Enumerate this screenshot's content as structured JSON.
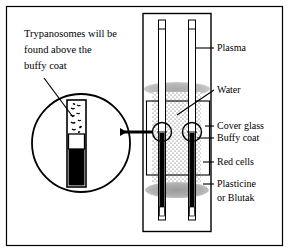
{
  "figure": {
    "title_annotation": {
      "lines": [
        "Trypanosomes will be",
        "found above the",
        "buffy coat"
      ]
    },
    "labels": [
      {
        "id": "plasma",
        "text": "Plasma"
      },
      {
        "id": "water",
        "text": "Water"
      },
      {
        "id": "cover-glass",
        "text": "Cover glass"
      },
      {
        "id": "buffy-coat",
        "text": "Buffy coat"
      },
      {
        "id": "red-cells",
        "text": "Red cells"
      },
      {
        "id": "plasticine",
        "text": "Plasticine"
      },
      {
        "id": "blutak",
        "text": "or Blutak"
      }
    ],
    "colors": {
      "ink": "#000000",
      "paper": "#ffffff",
      "plasticine_gray": "#a8a8a8",
      "water_stipple": "#555555",
      "band_gray": "#b4b4b4"
    },
    "diagram_parts": {
      "outer_border": "figure-frame",
      "magnifier": "magnified-capillary-detail",
      "apparatus": "haematocrit-tube-assembly",
      "tube_count": 2,
      "zones_top_to_bottom": [
        "plasma",
        "trypanosome-layer",
        "buffy-coat",
        "red-cells",
        "plasticine-seal"
      ]
    }
  }
}
